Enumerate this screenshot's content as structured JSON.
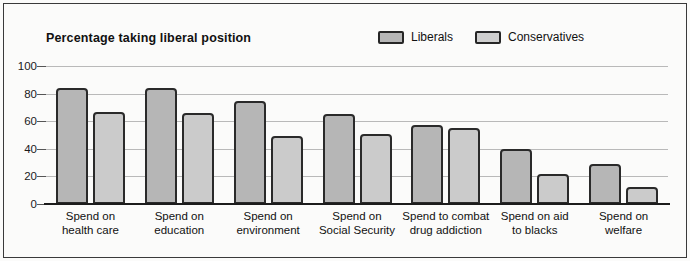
{
  "chart_data": {
    "type": "bar",
    "title": "Percentage taking liberal position",
    "xlabel": "",
    "ylabel": "",
    "ylim": [
      0,
      100
    ],
    "yticks": [
      0,
      20,
      40,
      60,
      80,
      100
    ],
    "grid": true,
    "legend_position": "top-right",
    "categories": [
      "Spend on health care",
      "Spend on education",
      "Spend on environment",
      "Spend on Social Security",
      "Spend to combat drug addiction",
      "Spend on aid to blacks",
      "Spend on welfare"
    ],
    "category_lines": [
      [
        "Spend on",
        "health care"
      ],
      [
        "Spend on",
        "education"
      ],
      [
        "Spend on",
        "environment"
      ],
      [
        "Spend on",
        "Social Security"
      ],
      [
        "Spend to combat",
        "drug addiction"
      ],
      [
        "Spend on aid",
        "to blacks"
      ],
      [
        "Spend on",
        "welfare"
      ]
    ],
    "series": [
      {
        "name": "Liberals",
        "color": "#b6b6b6",
        "values": [
          84,
          84,
          75,
          65,
          57,
          40,
          29
        ]
      },
      {
        "name": "Conservatives",
        "color": "#cbcbcb",
        "values": [
          67,
          66,
          49,
          51,
          55,
          22,
          12
        ]
      }
    ]
  },
  "legend": {
    "items": [
      {
        "label": "Liberals",
        "swatch_class": "liberals"
      },
      {
        "label": "Conservatives",
        "swatch_class": "conservatives"
      }
    ]
  },
  "colors": {
    "liberals_fill": "#b6b6b6",
    "conservatives_fill": "#cbcbcb",
    "bar_outline": "#2a2a2a",
    "gridline": "#b9b9b9",
    "axis": "#1c1c1c",
    "background": "#fbfbfa",
    "text": "#111111"
  }
}
